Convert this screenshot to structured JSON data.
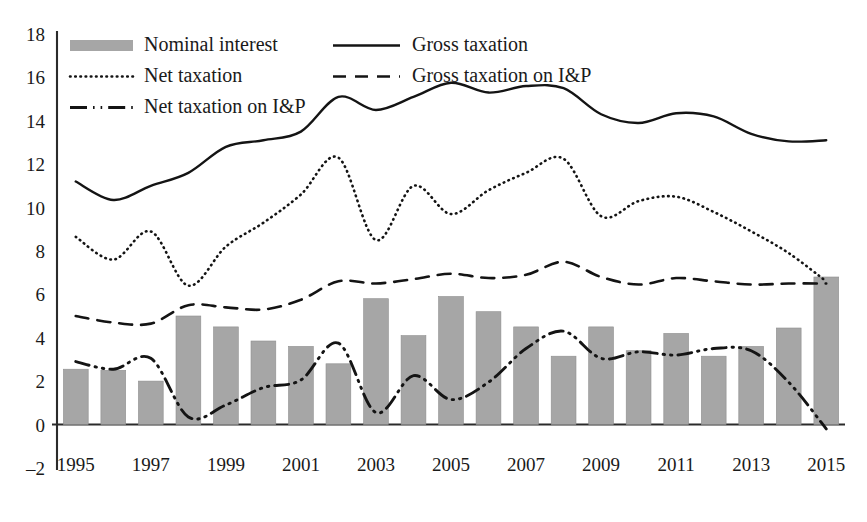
{
  "chart_data": {
    "type": "bar",
    "title": "",
    "subtitle": "",
    "xlabel": "",
    "ylabel": "",
    "ylim": [
      -2,
      18
    ],
    "ytick_step": 2,
    "grid": false,
    "legend_position": "top-left-inside",
    "x": [
      1995,
      1996,
      1997,
      1998,
      1999,
      2000,
      2001,
      2002,
      2003,
      2004,
      2005,
      2006,
      2007,
      2008,
      2009,
      2010,
      2011,
      2012,
      2013,
      2014,
      2015
    ],
    "categories": [
      "1995",
      "1996",
      "1997",
      "1998",
      "1999",
      "2000",
      "2001",
      "2002",
      "2003",
      "2004",
      "2005",
      "2006",
      "2007",
      "2008",
      "2009",
      "2010",
      "2011",
      "2012",
      "2013",
      "2014",
      "2015"
    ],
    "ytick_labels": [
      "18",
      "16",
      "14",
      "12",
      "10",
      "8",
      "6",
      "4",
      "2",
      "0",
      "-2"
    ],
    "ytick_values": [
      18,
      16,
      14,
      12,
      10,
      8,
      6,
      4,
      2,
      0,
      -2
    ],
    "xtick_labels": [
      "1995",
      "1997",
      "1999",
      "2001",
      "2003",
      "2005",
      "2007",
      "2009",
      "2011",
      "2013",
      "2015"
    ],
    "xtick_values": [
      1995,
      1997,
      1999,
      2001,
      2003,
      2005,
      2007,
      2009,
      2011,
      2013,
      2015
    ],
    "series": [
      {
        "name": "Nominal interest",
        "style": "bar",
        "color": "#a6a6a6",
        "values": [
          2.55,
          2.5,
          2.0,
          5.0,
          4.5,
          3.85,
          3.6,
          2.8,
          5.8,
          4.1,
          5.9,
          5.2,
          4.5,
          3.15,
          4.5,
          3.4,
          4.2,
          3.15,
          3.6,
          4.45,
          6.8
        ]
      },
      {
        "name": "Gross taxation",
        "style": "solid",
        "color": "#141414",
        "values": [
          11.2,
          10.35,
          11.0,
          11.6,
          12.8,
          13.1,
          13.5,
          15.1,
          14.5,
          15.1,
          15.75,
          15.3,
          15.6,
          15.5,
          14.3,
          13.9,
          14.35,
          14.2,
          13.4,
          13.05,
          13.1
        ]
      },
      {
        "name": "Net taxation",
        "style": "dotted",
        "color": "#141414",
        "values": [
          8.65,
          7.6,
          8.9,
          6.4,
          8.2,
          9.3,
          10.6,
          12.3,
          8.5,
          11.0,
          9.7,
          10.8,
          11.6,
          12.25,
          9.6,
          10.3,
          10.5,
          9.8,
          8.9,
          7.9,
          6.6
        ]
      },
      {
        "name": "Gross taxation on I&P",
        "style": "dashed",
        "color": "#141414",
        "values": [
          5.0,
          4.7,
          4.65,
          5.5,
          5.4,
          5.3,
          5.75,
          6.6,
          6.5,
          6.7,
          6.95,
          6.75,
          6.9,
          7.5,
          6.8,
          6.45,
          6.75,
          6.6,
          6.45,
          6.5,
          6.5
        ]
      },
      {
        "name": "Net taxation on I&P",
        "style": "dashdotdot",
        "color": "#141414",
        "values": [
          2.9,
          2.55,
          3.05,
          0.35,
          0.9,
          1.7,
          2.05,
          3.75,
          0.55,
          2.25,
          1.15,
          1.95,
          3.5,
          4.3,
          3.05,
          3.35,
          3.2,
          3.5,
          3.4,
          1.95,
          -0.2
        ]
      }
    ]
  },
  "legend": {
    "entries": [
      {
        "label": "Nominal interest",
        "marker": "bar-swatch"
      },
      {
        "label": "Gross taxation",
        "marker": "solid-line-swatch"
      },
      {
        "label": "Net taxation",
        "marker": "dotted-line-swatch"
      },
      {
        "label": "Gross taxation on I&P",
        "marker": "dashed-line-swatch"
      },
      {
        "label": "Net taxation on I&P",
        "marker": "dashdotdot-line-swatch"
      }
    ]
  },
  "colors": {
    "bar_fill": "#a6a6a6",
    "line": "#141414",
    "axis": "#2b2b2b",
    "background": "#ffffff",
    "text": "#1a1a1a"
  }
}
